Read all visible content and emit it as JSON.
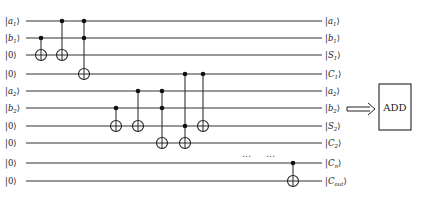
{
  "diagram": {
    "wires": [
      {
        "input": {
          "main": "a",
          "sub": "1"
        },
        "output": {
          "main": "a",
          "sub": "1"
        }
      },
      {
        "input": {
          "main": "b",
          "sub": "1"
        },
        "output": {
          "main": "b",
          "sub": "1"
        }
      },
      {
        "input": {
          "main": "0",
          "sub": ""
        },
        "output": {
          "main": "S",
          "sub": "1"
        }
      },
      {
        "input": {
          "main": "0",
          "sub": ""
        },
        "output": {
          "main": "C",
          "sub": "1"
        }
      },
      {
        "input": {
          "main": "a",
          "sub": "2"
        },
        "output": {
          "main": "a",
          "sub": "2"
        }
      },
      {
        "input": {
          "main": "b",
          "sub": "2"
        },
        "output": {
          "main": "b",
          "sub": "2"
        }
      },
      {
        "input": {
          "main": "0",
          "sub": ""
        },
        "output": {
          "main": "S",
          "sub": "2"
        }
      },
      {
        "input": {
          "main": "0",
          "sub": ""
        },
        "output": {
          "main": "C",
          "sub": "2"
        }
      },
      {
        "input": {
          "main": "0",
          "sub": ""
        },
        "output": {
          "main": "C",
          "sub": "n"
        }
      },
      {
        "input": {
          "main": "0",
          "sub": ""
        },
        "output": {
          "main": "C",
          "sub": "out"
        }
      }
    ],
    "gates": [
      {
        "type": "CNOT",
        "controls": [
          1
        ],
        "target": 2
      },
      {
        "type": "CNOT",
        "controls": [
          0
        ],
        "target": 2
      },
      {
        "type": "Toffoli",
        "controls": [
          0,
          1
        ],
        "target": 3
      },
      {
        "type": "CNOT",
        "controls": [
          5
        ],
        "target": 6
      },
      {
        "type": "CNOT",
        "controls": [
          4
        ],
        "target": 6
      },
      {
        "type": "Toffoli",
        "controls": [
          4,
          5
        ],
        "target": 7
      },
      {
        "type": "Toffoli",
        "controls": [
          3,
          6
        ],
        "target": 7
      },
      {
        "type": "CNOT",
        "controls": [
          3
        ],
        "target": 6
      },
      {
        "type": "CNOT",
        "controls": [
          8
        ],
        "target": 9
      }
    ],
    "ellipsis": [
      "…",
      "…"
    ],
    "block_label": "ADD",
    "arrow": "double-right-arrow"
  }
}
